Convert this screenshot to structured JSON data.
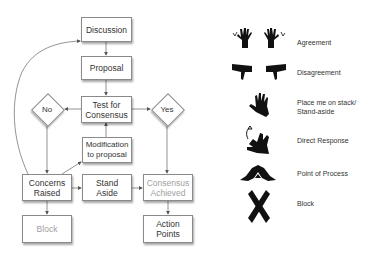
{
  "flowchart": {
    "nodes": {
      "discussion": "Discussion",
      "proposal": "Proposal",
      "test_for_consensus": "Test for Consensus",
      "no": "No",
      "yes": "Yes",
      "modification": "Modification to proposal",
      "concerns_raised": "Concerns Raised",
      "stand_aside": "Stand Aside",
      "consensus_achieved": "Consensus Achieved",
      "block": "Block",
      "action_points": "Action Points"
    },
    "edges": [
      [
        "Discussion",
        "Proposal"
      ],
      [
        "Proposal",
        "Test for Consensus"
      ],
      [
        "Test for Consensus",
        "No"
      ],
      [
        "Test for Consensus",
        "Yes"
      ],
      [
        "No",
        "Concerns Raised"
      ],
      [
        "Yes",
        "Consensus Achieved"
      ],
      [
        "Modification to proposal",
        "Test for Consensus"
      ],
      [
        "Concerns Raised",
        "Modification to proposal"
      ],
      [
        "Concerns Raised",
        "Stand Aside"
      ],
      [
        "Stand Aside",
        "Consensus Achieved"
      ],
      [
        "Concerns Raised",
        "Block"
      ],
      [
        "Consensus Achieved",
        "Action Points"
      ],
      [
        "Concerns Raised",
        "Discussion"
      ]
    ]
  },
  "legend": {
    "items": [
      {
        "icon": "agreement-hands-icon",
        "label": "Agreement"
      },
      {
        "icon": "disagreement-thumbs-down-icon",
        "label": "Disagreement"
      },
      {
        "icon": "raised-hand-icon",
        "label": "Place me on stack/ Stand-aside"
      },
      {
        "icon": "direct-response-hand-icon",
        "label": "Direct Response"
      },
      {
        "icon": "point-of-process-triangle-icon",
        "label": "Point of Process"
      },
      {
        "icon": "crossed-arms-icon",
        "label": "Block"
      }
    ]
  }
}
